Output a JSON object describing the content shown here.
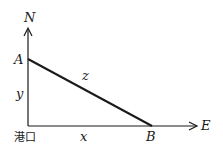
{
  "diagram": {
    "axes": {
      "north_label": "N",
      "east_label": "E",
      "origin_label": "港口"
    },
    "points": {
      "A": "A",
      "B": "B"
    },
    "segments": {
      "y_label": "y",
      "x_label": "x",
      "z_label": "z"
    },
    "colors": {
      "line": "#1a1a1a",
      "background": "#ffffff"
    }
  }
}
